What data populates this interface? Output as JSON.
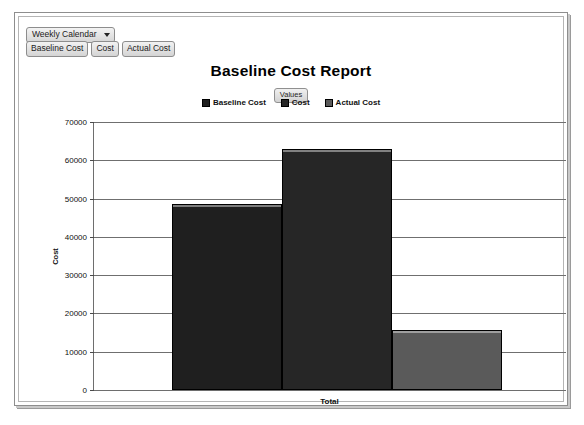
{
  "toolbar": {
    "calendar_select": {
      "value": "Weekly Calendar",
      "caret_icon": "chevron-down-icon"
    },
    "filters": [
      {
        "label": "Baseline Cost"
      },
      {
        "label": "Cost"
      },
      {
        "label": "Actual Cost"
      }
    ]
  },
  "chart_header": {
    "title": "Baseline Cost Report",
    "values_badge": "Values"
  },
  "chart_data": {
    "type": "bar",
    "title": "Baseline Cost Report",
    "categories": [
      "Total"
    ],
    "xlabel": "Total",
    "ylabel": "Cost",
    "ylim": [
      0,
      70000
    ],
    "ytick_labels": [
      "70000",
      "60000",
      "50000",
      "40000",
      "30000",
      "20000",
      "10000",
      "0"
    ],
    "yticks": [
      70000,
      60000,
      50000,
      40000,
      30000,
      20000,
      10000,
      0
    ],
    "grid": true,
    "legend_position": "top",
    "series": [
      {
        "name": "Baseline Cost",
        "values": [
          48500
        ],
        "color": "#1f1f1f"
      },
      {
        "name": "Cost",
        "values": [
          63000
        ],
        "color": "#262626"
      },
      {
        "name": "Actual Cost",
        "values": [
          15600
        ],
        "color": "#5a5a5a"
      }
    ]
  }
}
